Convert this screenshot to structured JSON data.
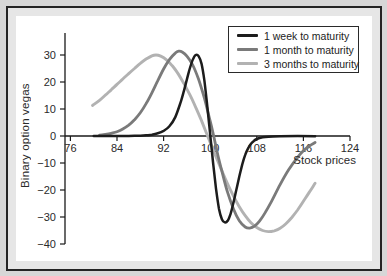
{
  "figure": {
    "background": "#e6e6e6",
    "panel_background": "#ffffff",
    "border_color": "#242424",
    "axis_color": "#1a1a1a",
    "text_color": "#2a2a2a"
  },
  "chart_data": {
    "type": "line",
    "title": "",
    "xlabel": "Stock prices",
    "ylabel": "Binary option vegas",
    "xlim": [
      74,
      124
    ],
    "ylim": [
      -40,
      38
    ],
    "grid": false,
    "legend_position": "top-right",
    "x_ticks": [
      76,
      84,
      92,
      100,
      108,
      116,
      124
    ],
    "x_tick_labels": [
      "76",
      "84",
      "92",
      "100",
      "108",
      "116",
      "124"
    ],
    "y_ticks": [
      30,
      20,
      10,
      0,
      -10,
      -20,
      -30,
      -40
    ],
    "y_tick_labels": [
      "30",
      "20",
      "10",
      "0",
      "−10",
      "−20",
      "−30",
      "−40"
    ],
    "series": [
      {
        "name": "1 week to maturity",
        "color": "#1c1c1c",
        "width": 2.5,
        "points": [
          [
            80,
            0
          ],
          [
            84,
            0
          ],
          [
            86,
            0.05
          ],
          [
            88,
            0.1
          ],
          [
            89,
            0.25
          ],
          [
            90,
            0.5
          ],
          [
            91,
            1
          ],
          [
            92,
            1.9
          ],
          [
            93,
            3.6
          ],
          [
            94,
            7
          ],
          [
            95,
            13
          ],
          [
            95.5,
            16.8
          ],
          [
            96,
            21
          ],
          [
            96.5,
            25
          ],
          [
            97,
            28.2
          ],
          [
            97.5,
            30
          ],
          [
            98,
            29.6
          ],
          [
            98.5,
            26.8
          ],
          [
            99,
            20.5
          ],
          [
            99.5,
            11
          ],
          [
            100,
            0.5
          ],
          [
            100.5,
            -10
          ],
          [
            101,
            -19.5
          ],
          [
            101.5,
            -26.8
          ],
          [
            102,
            -30.8
          ],
          [
            102.5,
            -32
          ],
          [
            103,
            -31.4
          ],
          [
            103.5,
            -28.8
          ],
          [
            104,
            -24.6
          ],
          [
            104.5,
            -19.8
          ],
          [
            105,
            -15
          ],
          [
            105.5,
            -10.6
          ],
          [
            106,
            -7
          ],
          [
            106.5,
            -4.6
          ],
          [
            107,
            -2.9
          ],
          [
            107.5,
            -1.8
          ],
          [
            108,
            -1.1
          ],
          [
            109,
            -0.5
          ],
          [
            110,
            -0.25
          ],
          [
            112,
            -0.1
          ],
          [
            115,
            -0.05
          ],
          [
            118,
            -0.1
          ]
        ]
      },
      {
        "name": "1 month to maturity",
        "color": "#7a7a7a",
        "width": 2.8,
        "points": [
          [
            81,
            0.3
          ],
          [
            82,
            0.6
          ],
          [
            83,
            1
          ],
          [
            84,
            1.6
          ],
          [
            85,
            2.6
          ],
          [
            86,
            4
          ],
          [
            87,
            6
          ],
          [
            88,
            8.6
          ],
          [
            89,
            12
          ],
          [
            90,
            16
          ],
          [
            91,
            20.5
          ],
          [
            92,
            24.8
          ],
          [
            93,
            28.3
          ],
          [
            94,
            30.7
          ],
          [
            94.6,
            31.4
          ],
          [
            95.2,
            31.1
          ],
          [
            96,
            29.6
          ],
          [
            97,
            26.3
          ],
          [
            98,
            21
          ],
          [
            99,
            14
          ],
          [
            100,
            5.5
          ],
          [
            100.6,
            0
          ],
          [
            101.2,
            -6
          ],
          [
            102,
            -13
          ],
          [
            103,
            -21
          ],
          [
            104,
            -27
          ],
          [
            105,
            -31.4
          ],
          [
            106,
            -33.7
          ],
          [
            106.8,
            -34.1
          ],
          [
            107.6,
            -33.4
          ],
          [
            108.5,
            -31.4
          ],
          [
            109.5,
            -28.2
          ],
          [
            110.5,
            -24.3
          ],
          [
            112,
            -18
          ],
          [
            113.5,
            -12.4
          ],
          [
            115,
            -7.9
          ],
          [
            116,
            -5.5
          ],
          [
            117,
            -3.7
          ],
          [
            118,
            -2.4
          ]
        ]
      },
      {
        "name": "3 months to maturity",
        "color": "#b2b2b2",
        "width": 2.9,
        "points": [
          [
            79.8,
            11.3
          ],
          [
            81,
            13.2
          ],
          [
            82,
            15.1
          ],
          [
            83,
            17.1
          ],
          [
            84,
            19.1
          ],
          [
            85,
            21.1
          ],
          [
            86,
            23.1
          ],
          [
            87,
            25
          ],
          [
            88,
            26.9
          ],
          [
            89,
            28.5
          ],
          [
            90,
            29.7
          ],
          [
            90.7,
            30
          ],
          [
            91.5,
            29.6
          ],
          [
            92.5,
            28.2
          ],
          [
            93.5,
            26
          ],
          [
            94.5,
            23
          ],
          [
            95.5,
            19.4
          ],
          [
            96.5,
            15.3
          ],
          [
            97.5,
            10.7
          ],
          [
            98.5,
            5.7
          ],
          [
            99.3,
            1.4
          ],
          [
            100,
            -2.4
          ],
          [
            101,
            -7.7
          ],
          [
            102,
            -12.9
          ],
          [
            103,
            -17.8
          ],
          [
            104,
            -22.3
          ],
          [
            105,
            -26.2
          ],
          [
            106,
            -29.5
          ],
          [
            107,
            -32.1
          ],
          [
            108,
            -33.9
          ],
          [
            109,
            -35
          ],
          [
            110,
            -35.4
          ],
          [
            111,
            -35.1
          ],
          [
            112,
            -34.2
          ],
          [
            113,
            -32.5
          ],
          [
            114,
            -30.2
          ],
          [
            115,
            -27.4
          ],
          [
            116,
            -24.2
          ],
          [
            117,
            -20.9
          ],
          [
            118,
            -17.5
          ]
        ]
      }
    ]
  }
}
